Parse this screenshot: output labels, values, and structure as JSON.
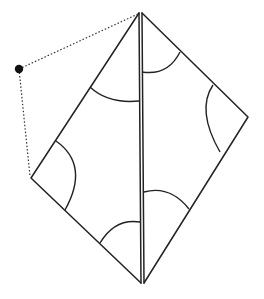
{
  "diagram": {
    "colors": {
      "stroke": "#222222",
      "point": "#111111",
      "background": "#ffffff"
    },
    "shapes": {
      "left_triangle": "left half of kite",
      "right_triangle": "right half of kite",
      "fold_line": "double vertical line (two parallel strokes)"
    },
    "angle_marks": [
      "top-left-angle",
      "left-vertex-angle",
      "bottom-left-angle",
      "top-right-angle",
      "right-vertex-angle",
      "bottom-right-angle"
    ],
    "external_point": "filled black dot connected by dotted lines to top apex and left vertex"
  }
}
